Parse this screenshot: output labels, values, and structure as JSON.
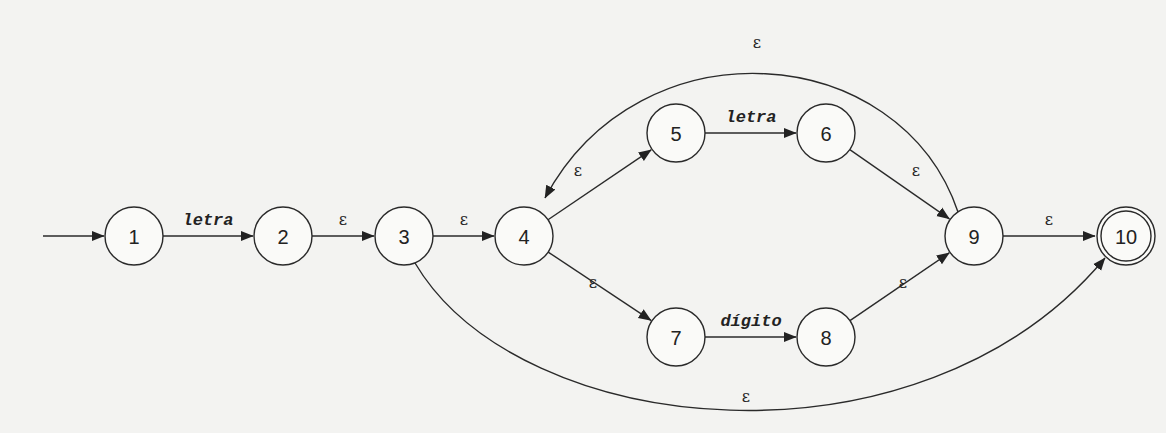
{
  "diagram": {
    "type": "nfa",
    "start_state": "1",
    "accepting_states": [
      "10"
    ],
    "states": [
      {
        "id": "1",
        "label": "1"
      },
      {
        "id": "2",
        "label": "2"
      },
      {
        "id": "3",
        "label": "3"
      },
      {
        "id": "4",
        "label": "4"
      },
      {
        "id": "5",
        "label": "5"
      },
      {
        "id": "6",
        "label": "6"
      },
      {
        "id": "7",
        "label": "7"
      },
      {
        "id": "8",
        "label": "8"
      },
      {
        "id": "9",
        "label": "9"
      },
      {
        "id": "10",
        "label": "10"
      }
    ],
    "transitions": [
      {
        "from": "1",
        "to": "2",
        "label": "letra",
        "kind": "symbol"
      },
      {
        "from": "2",
        "to": "3",
        "label": "ε",
        "kind": "epsilon"
      },
      {
        "from": "3",
        "to": "4",
        "label": "ε",
        "kind": "epsilon"
      },
      {
        "from": "4",
        "to": "5",
        "label": "ε",
        "kind": "epsilon"
      },
      {
        "from": "4",
        "to": "7",
        "label": "ε",
        "kind": "epsilon"
      },
      {
        "from": "5",
        "to": "6",
        "label": "letra",
        "kind": "symbol"
      },
      {
        "from": "7",
        "to": "8",
        "label": "dígito",
        "kind": "symbol"
      },
      {
        "from": "6",
        "to": "9",
        "label": "ε",
        "kind": "epsilon"
      },
      {
        "from": "8",
        "to": "9",
        "label": "ε",
        "kind": "epsilon"
      },
      {
        "from": "9",
        "to": "4",
        "label": "ε",
        "kind": "epsilon"
      },
      {
        "from": "9",
        "to": "10",
        "label": "ε",
        "kind": "epsilon"
      },
      {
        "from": "3",
        "to": "10",
        "label": "ε",
        "kind": "epsilon"
      }
    ]
  }
}
